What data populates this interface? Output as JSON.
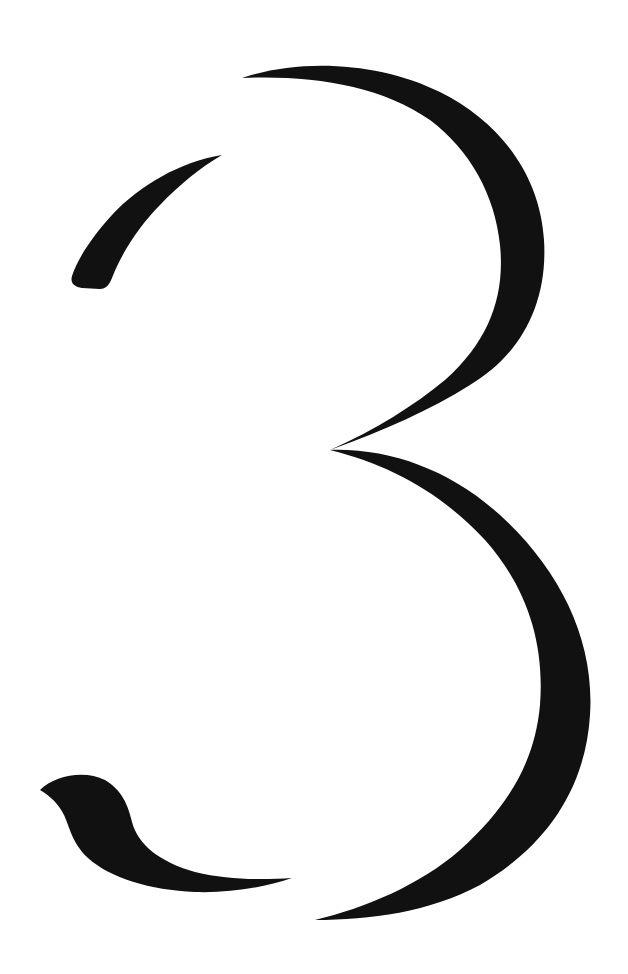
{
  "figure": {
    "character": "3",
    "ink_color": "#111111",
    "background_color": "#ffffff",
    "parts": [
      {
        "name": "top-left-stroke",
        "bbox": [
          70,
          155,
          222,
          287
        ]
      },
      {
        "name": "upper-bowl",
        "bbox": [
          240,
          65,
          545,
          450
        ]
      },
      {
        "name": "lower-bowl",
        "bbox": [
          315,
          435,
          592,
          920
        ]
      },
      {
        "name": "bottom-left-tail",
        "bbox": [
          40,
          773,
          292,
          893
        ]
      }
    ]
  }
}
